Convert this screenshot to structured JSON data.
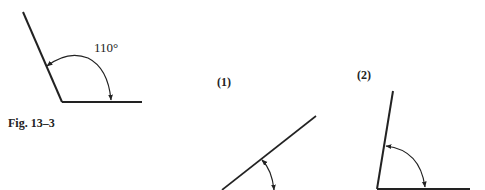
{
  "figure": {
    "caption": "Fig. 13–3",
    "main_angle": {
      "label": "110°",
      "degrees": 110
    },
    "exercises": [
      {
        "label": "(1)"
      },
      {
        "label": "(2)"
      }
    ]
  },
  "colors": {
    "line": "#222222",
    "background": "#ffffff"
  }
}
